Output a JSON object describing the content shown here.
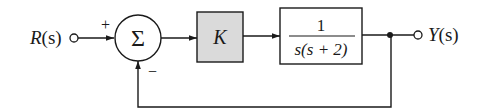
{
  "diagram": {
    "type": "block-diagram",
    "input": {
      "label": "R(s)",
      "name": "R",
      "arg": "(s)"
    },
    "output": {
      "label": "Y(s)",
      "name": "Y",
      "arg": "(s)"
    },
    "summing_junction": {
      "symbol": "Σ",
      "signs": {
        "reference": "+",
        "feedback": "−"
      }
    },
    "blocks": [
      {
        "id": "controller",
        "label": "K",
        "fill": "#dadada"
      },
      {
        "id": "plant",
        "numerator": "1",
        "denominator": "s(s + 2)",
        "fill": "#ffffff"
      }
    ],
    "feedback": {
      "type": "unity",
      "sign": "negative"
    },
    "colors": {
      "line": "#1a1a1a",
      "gain_block_fill": "#dadada",
      "background": "#ffffff"
    }
  }
}
